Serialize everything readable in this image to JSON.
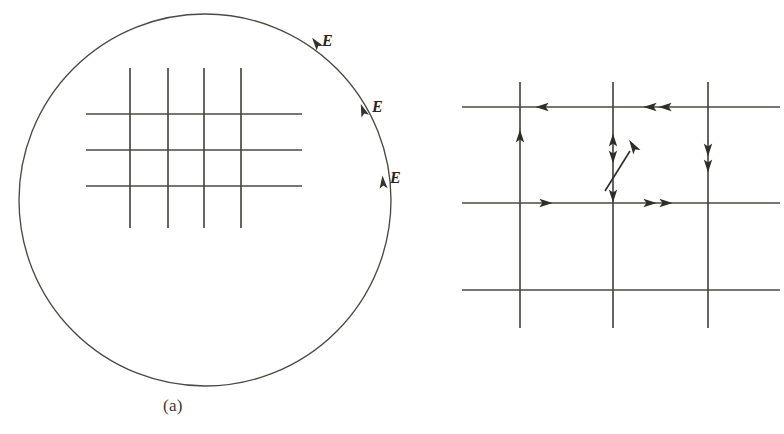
{
  "figure": {
    "background": "#ffffff",
    "ink_color": "#4a4a40",
    "text_color": "#3a3a34",
    "panels": [
      {
        "id": "a",
        "caption": "(a)",
        "description": "large circle with a rectangular grid of field lines inside, field vectors E tangent along the right side of the circle",
        "field_labels": [
          "E",
          "E",
          "E"
        ]
      },
      {
        "id": "b",
        "caption": "(b)",
        "description": "close-up grid of intersecting field lines with direction arrowheads, labelled points A and B and surfaces S1 and S2, with an oblique field vector E",
        "point_labels": [
          "A",
          "B"
        ],
        "surface_labels": [
          "S",
          "S"
        ],
        "surface_subscripts": [
          "1",
          "2"
        ],
        "field_label": "E"
      }
    ]
  },
  "labels": {
    "caption_a": "(a)",
    "caption_b": "(b)",
    "e_a1": "E",
    "e_a2": "E",
    "e_a3": "E",
    "e_b": "E",
    "point_a": "A",
    "point_b": "B",
    "s1_base": "S",
    "s1_sub": "1",
    "s2_base": "S",
    "s2_sub": "2"
  },
  "geometry": {
    "circle": {
      "cx": 205,
      "cy": 200,
      "r": 186
    },
    "panel_a_grid": {
      "vertical_x": [
        130,
        168,
        204,
        241
      ],
      "vertical_y0": 68,
      "vertical_y1": 228,
      "horizontal_y": [
        114,
        150,
        186
      ],
      "horizontal_x0": 86,
      "horizontal_x1": 302
    },
    "panel_b_grid": {
      "vertical_x": [
        520,
        613,
        708
      ],
      "vertical_y0": 82,
      "vertical_y1": 328,
      "horizontal_y": [
        107,
        203,
        290
      ],
      "horizontal_x0": 462,
      "horizontal_x1": 778
    }
  }
}
